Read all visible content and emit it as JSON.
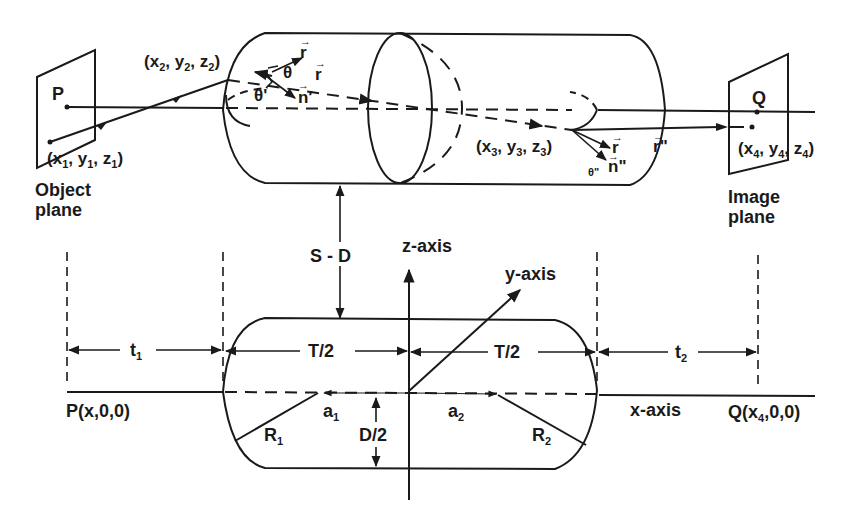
{
  "top_view": {
    "object_plane": {
      "point_label": "P",
      "coord": {
        "x": "x",
        "xs": "1",
        "y": "y",
        "ys": "1",
        "z": "z",
        "zs": "1"
      },
      "caption_line1": "Object",
      "caption_line2": "plane"
    },
    "entry_point": {
      "x": "x",
      "xs": "2",
      "y": "y",
      "ys": "2",
      "z": "z",
      "zs": "2"
    },
    "exit_point": {
      "x": "x",
      "xs": "3",
      "y": "y",
      "ys": "3",
      "z": "z",
      "zs": "3"
    },
    "image_plane": {
      "point_label": "Q",
      "coord": {
        "x": "x",
        "xs": "4",
        "y": "y",
        "ys": "4",
        "z": "z",
        "zs": "4"
      },
      "caption_line1": "Image",
      "caption_line2": "plane"
    },
    "vectors": {
      "r_in": "r",
      "r_prime": "r",
      "n_prime": "n",
      "r_double_prime": "r",
      "n_double_prime": "n",
      "r_out": "r"
    },
    "angles": {
      "theta": "θ",
      "theta_prime": "θ'",
      "theta_double_prime": "θ\""
    },
    "separation_label": "S  -  D"
  },
  "cross_section": {
    "z_axis_label": "z-axis",
    "y_axis_label": "y-axis",
    "x_axis_label": "x-axis",
    "left_point": "P(x,0,0)",
    "right_point_prefix": "Q(x",
    "right_point_sub": "4",
    "right_point_suffix": ",0,0)",
    "t1": {
      "base": "t",
      "sub": "1"
    },
    "t2": {
      "base": "t",
      "sub": "2"
    },
    "half_thickness_left": "T/2",
    "half_thickness_right": "T/2",
    "a1": {
      "base": "a",
      "sub": "1"
    },
    "a2": {
      "base": "a",
      "sub": "2"
    },
    "R1": {
      "base": "R",
      "sub": "1"
    },
    "R2": {
      "base": "R",
      "sub": "2"
    },
    "half_diameter": "D/2"
  }
}
